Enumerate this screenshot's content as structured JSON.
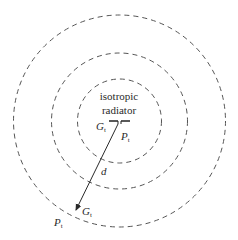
{
  "diagram": {
    "title_line1": "isotropic",
    "title_line2": "radiator",
    "tx_gain": "G",
    "tx_gain_sub": "t",
    "tx_power": "P",
    "tx_power_sub": "t",
    "distance": "d",
    "rx_gain": "G",
    "rx_gain_sub": "t",
    "rx_power": "P",
    "rx_power_sub": "t",
    "circles": [
      {
        "name": "inner",
        "radius": 42
      },
      {
        "name": "middle",
        "radius": 68
      },
      {
        "name": "outer",
        "radius": 106
      }
    ],
    "colors": {
      "line": "#3a3a3a",
      "dash": "#555555",
      "background": "#ffffff"
    }
  }
}
